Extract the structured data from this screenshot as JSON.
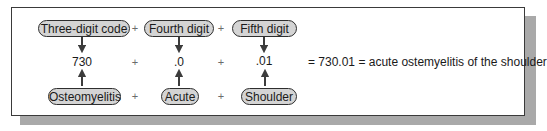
{
  "diagram": {
    "type": "code-composition",
    "top_row": [
      {
        "label": "Three-digit code"
      },
      {
        "label": "Fourth digit"
      },
      {
        "label": "Fifth digit"
      }
    ],
    "middle_row": [
      {
        "value": "730"
      },
      {
        "value": ".0"
      },
      {
        "value": ".01"
      }
    ],
    "bottom_row": [
      {
        "label": "Osteomyelitis"
      },
      {
        "label": "Acute"
      },
      {
        "label": "Shoulder"
      }
    ],
    "operator": "+",
    "equation": "= 730.01 = acute ostemyelitis of the shoulder",
    "colors": {
      "pill_fill": "#d4d4d4",
      "pill_border": "#2e2e2e",
      "arrow": "#3c3c3c",
      "shadow": "#a9a9a9",
      "frame_border": "#3a3a3a"
    }
  }
}
